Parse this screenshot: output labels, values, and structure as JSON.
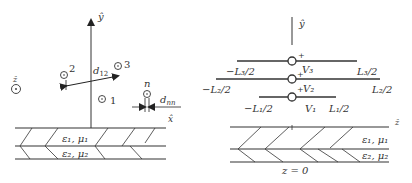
{
  "left_panel": {
    "axis_y_label": "ŷ",
    "axis_x_label": "x̂",
    "axis_z_label": "ẑ",
    "conductor_labels": [
      "1",
      "2",
      "3"
    ],
    "distance_label_main": "d",
    "distance_label_sub": "12",
    "conductor_n_label": "n",
    "dnn_main": "d",
    "dnn_sub": "nn",
    "layer1_label": "ε₁, μ₁",
    "layer2_label": "ε₂, μ₂"
  },
  "right_panel": {
    "axis_y_label": "ŷ",
    "axis_z_label": "ẑ",
    "z_zero_label": "z = 0",
    "wires": [
      {
        "left": "−L₁/2",
        "right": "L₁/2",
        "voltage": "V₁",
        "plus": "+"
      },
      {
        "left": "−L₂/2",
        "right": "L₂/2",
        "voltage": "V₂",
        "plus": "+"
      },
      {
        "left": "−L₃/2",
        "right": "L₃/2",
        "voltage": "V₃",
        "plus": "+"
      }
    ],
    "layer1_label": "ε₁, μ₁",
    "layer2_label": "ε₂, μ₂"
  }
}
